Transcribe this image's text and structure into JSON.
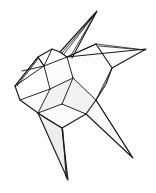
{
  "figure": {
    "kind": "line-art",
    "background_color": "#ffffff",
    "stroke_color": "#1a1a1a",
    "fill_light": "#fbfbfb",
    "fill_shade": "#f2f2f2",
    "canvas": {
      "width": 156,
      "height": 193
    }
  },
  "geometry": {
    "body_outline": "M 15,86 L 38,57 L 52,49 L 60,52 L 67,57 L 96,44 L 112,68 L 106,84 L 96,100 L 86,114 L 62,128 L 47,119 L 38,113 L 20,100 Z",
    "spikes": [
      {
        "name": "top-fin",
        "outer": "M 60,52 L 97,11 L 72,58",
        "inner": "M 62,53 L 96,13 L 70,57",
        "ridge": "M 64,54 L 95,14",
        "tip": [
          97,
          11
        ]
      },
      {
        "name": "right-wing",
        "outer": "M 67,57 L 146,49 L 112,68",
        "inner": "M 96,44 L 145,50",
        "ridge": "M 99,46 L 144,50",
        "tip": [
          146,
          49
        ]
      },
      {
        "name": "bottom-fin",
        "outer": "M 38,113 L 68,180 L 62,128",
        "inner": "M 62,128 L 67,179",
        "ridge": "M 63,130 L 66,177",
        "tip": [
          68,
          180
        ]
      },
      {
        "name": "lower-right-tail",
        "outer": "M 86,114 L 133,158 L 96,100",
        "inner": "M 96,100 L 132,157",
        "tip": [
          133,
          158
        ]
      },
      {
        "name": "left-head",
        "outer": "M 15,86 L 38,57 L 44,66",
        "inner": "M 17,86 L 38,59",
        "tip": [
          15,
          86
        ]
      }
    ],
    "creases": [
      "M 38,57 L 44,66 L 52,49",
      "M 44,66 L 22,71",
      "M 15,86 L 44,66",
      "M 44,66 L 67,57",
      "M 67,57 L 73,78",
      "M 73,78 L 50,89",
      "M 50,89 L 44,66",
      "M 50,89 L 38,113",
      "M 73,78 L 62,104",
      "M 62,104 L 38,113",
      "M 62,104 L 86,114",
      "M 73,78 L 96,100",
      "M 20,100 L 50,89",
      "M 38,113 L 62,128",
      "M 96,44 L 67,57",
      "M 112,68 L 96,100"
    ],
    "facets": [
      {
        "name": "facet-upper-left",
        "path": "M 15,86 L 38,57 L 44,66 L 22,71 Z",
        "shade": "light"
      },
      {
        "name": "facet-upper-mid",
        "path": "M 44,66 L 67,57 L 73,78 L 50,89 Z",
        "shade": "light"
      },
      {
        "name": "facet-center",
        "path": "M 50,89 L 73,78 L 62,104 L 38,113 Z",
        "shade": "shade"
      },
      {
        "name": "facet-lower-left",
        "path": "M 20,100 L 50,89 L 38,113 Z",
        "shade": "light"
      },
      {
        "name": "facet-lower-mid",
        "path": "M 62,104 L 86,114 L 62,128 L 38,113 Z",
        "shade": "light"
      },
      {
        "name": "facet-right",
        "path": "M 73,78 L 96,100 L 86,114 L 62,104 Z",
        "shade": "shade"
      },
      {
        "name": "facet-bottom-fin",
        "path": "M 38,113 L 68,180 L 62,128 Z",
        "shade": "shade2"
      },
      {
        "name": "facet-top-fin",
        "path": "M 60,52 L 97,11 L 72,58 Z",
        "shade": "light"
      },
      {
        "name": "facet-right-wing",
        "path": "M 67,57 L 146,49 L 112,68 Z",
        "shade": "light"
      },
      {
        "name": "facet-lower-right-tail",
        "path": "M 86,114 L 133,158 L 96,100 Z",
        "shade": "light"
      }
    ]
  }
}
